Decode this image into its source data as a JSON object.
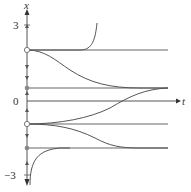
{
  "diagram": {
    "type": "phase line / solution curves",
    "axes": {
      "vertical_label": "x",
      "horizontal_label": "t",
      "tick_labels": {
        "top": "3",
        "zero": "0",
        "bottom": "−3"
      }
    },
    "equilibria": [
      {
        "name": "upper-unstable",
        "marker": "open"
      },
      {
        "name": "upper-stable",
        "marker": "filled"
      },
      {
        "name": "lower-unstable",
        "marker": "open"
      },
      {
        "name": "lower-stable",
        "marker": "filled"
      }
    ],
    "colors": {
      "axis": "#333333",
      "equilibrium_line": "#9a9a9a",
      "curve": "#555555"
    }
  }
}
